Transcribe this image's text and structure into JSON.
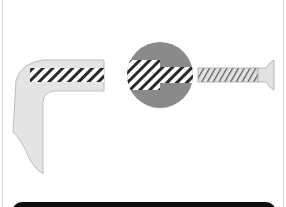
{
  "diagram": {
    "title": "",
    "parts": [
      {
        "name": "l-bracket",
        "label": ""
      },
      {
        "name": "magnified-joint",
        "label": ""
      },
      {
        "name": "screw",
        "label": ""
      }
    ],
    "colors": {
      "background": "#ffffff",
      "bracket_fill": "#e4e4e4",
      "bracket_stroke": "#bdbdbd",
      "hatch_dark": "#2a2a2a",
      "hatch_light": "#ffffff",
      "magnifier_fill": "#8a8a8a",
      "screw_fill": "#e2e2e2",
      "screw_thread": "#555555",
      "bottom_bar": "#0e0e0e",
      "frame_border": "#d8d8d8"
    }
  }
}
